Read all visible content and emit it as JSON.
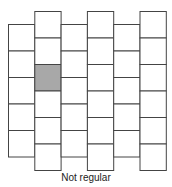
{
  "figure": {
    "caption": "Not regular",
    "colors": {
      "line": "#444444",
      "fill": "#ffffff",
      "shaded": "#a8a8a8"
    },
    "grid": {
      "x0": 8.5,
      "col_width": 26.3,
      "cell_height": 26.5,
      "columns": [
        {
          "index": 1,
          "top": 24.5,
          "cells": 5
        },
        {
          "index": 2,
          "top": 11.5,
          "cells": 6
        },
        {
          "index": 3,
          "top": 24.5,
          "cells": 5
        },
        {
          "index": 4,
          "top": 11.5,
          "cells": 6
        },
        {
          "index": 5,
          "top": 24.5,
          "cells": 5
        },
        {
          "index": 6,
          "top": 11.5,
          "cells": 6
        }
      ],
      "shaded_cells": [
        {
          "column": 2,
          "cell": 3
        }
      ]
    }
  }
}
